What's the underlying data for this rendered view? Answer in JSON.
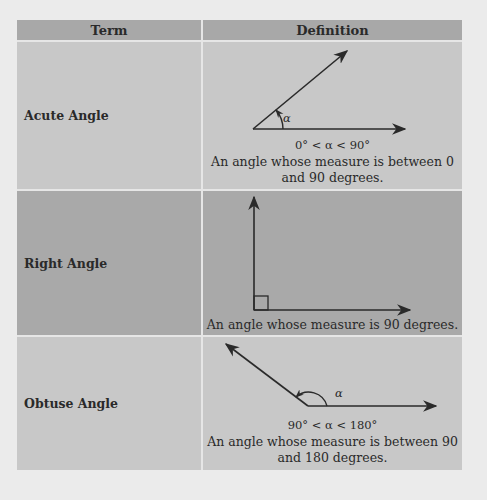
{
  "table": {
    "headers": {
      "term": "Term",
      "definition": "Definition"
    },
    "rows": [
      {
        "term": "Acute Angle",
        "condition": "0° < α < 90°",
        "definition_line1": "An angle whose measure is between 0",
        "definition_line2": "and 90 degrees.",
        "angle_label": "α"
      },
      {
        "term": "Right Angle",
        "definition_line1": "An angle whose measure is 90 degrees."
      },
      {
        "term": "Obtuse Angle",
        "condition": "90° < α < 180°",
        "definition_line1": "An angle whose measure is between 90",
        "definition_line2": "and 180 degrees.",
        "angle_label": "α"
      }
    ]
  },
  "colors": {
    "page_background": "#ebebeb",
    "header_background": "#a8a8a8",
    "row_light": "#c8c8c8",
    "row_dark": "#a9a9a9",
    "line": "#2a2a2a"
  }
}
